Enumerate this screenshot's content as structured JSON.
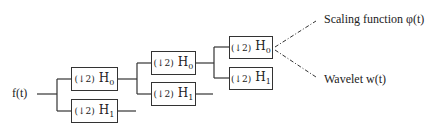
{
  "diagram": {
    "input_label": "f(t)",
    "levels": [
      {
        "h0": {
          "op": "(↓2)",
          "filter": "H",
          "index": "0"
        },
        "h1": {
          "op": "(↓2)",
          "filter": "H",
          "index": "1"
        }
      },
      {
        "h0": {
          "op": "(↓2)",
          "filter": "H",
          "index": "0"
        },
        "h1": {
          "op": "(↓2)",
          "filter": "H",
          "index": "1"
        }
      },
      {
        "h0": {
          "op": "(↓2)",
          "filter": "H",
          "index": "0"
        },
        "h1": {
          "op": "(↓2)",
          "filter": "H",
          "index": "1"
        }
      }
    ],
    "outputs": {
      "scaling": "Scaling function  φ(t)",
      "wavelet": "Wavelet  w(t)"
    }
  }
}
